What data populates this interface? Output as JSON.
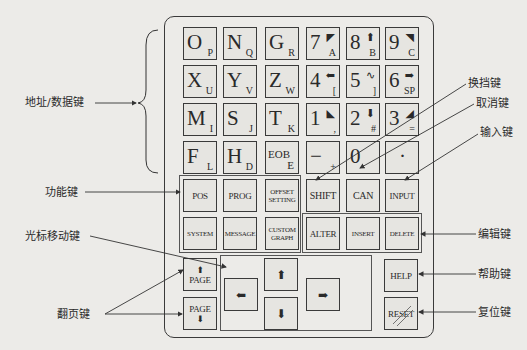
{
  "panel": {
    "address_data_keys": [
      {
        "main": "O",
        "sub": "P"
      },
      {
        "main": "N",
        "sub": "Q"
      },
      {
        "main": "G",
        "sub": "R"
      },
      {
        "main": "7",
        "glyph": "◤",
        "sub": "A"
      },
      {
        "main": "8",
        "glyph": "⬆",
        "sub": "B"
      },
      {
        "main": "9",
        "glyph": "◥",
        "sub": "C"
      },
      {
        "main": "X",
        "sub": "U"
      },
      {
        "main": "Y",
        "sub": "V"
      },
      {
        "main": "Z",
        "sub": "W"
      },
      {
        "main": "4",
        "glyph": "⬅",
        "sub": "["
      },
      {
        "main": "5",
        "glyph": "∿",
        "sub": "]"
      },
      {
        "main": "6",
        "glyph": "➡",
        "sub": "SP"
      },
      {
        "main": "M",
        "sub": "I"
      },
      {
        "main": "S",
        "sub": "J"
      },
      {
        "main": "T",
        "sub": "K"
      },
      {
        "main": "1",
        "glyph": "◣",
        "sub": ","
      },
      {
        "main": "2",
        "glyph": "⬇",
        "sub": "#"
      },
      {
        "main": "3",
        "glyph": "◢",
        "sub": "="
      },
      {
        "main": "F",
        "sub": "L"
      },
      {
        "main": "H",
        "sub": "D"
      },
      {
        "main": "EOB",
        "sub": "E"
      },
      {
        "main": "−",
        "sub": "+"
      },
      {
        "main": "0",
        "sub": "*"
      },
      {
        "main": "·",
        "sub": "/"
      }
    ],
    "function_keys": {
      "pos": "POS",
      "prog": "PROG",
      "offset_setting": "OFFSET SETTING",
      "system": "SYSTEM",
      "message": "MESSAGE",
      "custom_graph": "CUSTOM GRAPH"
    },
    "shift": "SHIFT",
    "can": "CAN",
    "input": "INPUT",
    "alter": "ALTER",
    "insert": "INSERT",
    "delete": "DELETE",
    "page_up": {
      "label": "PAGE",
      "arrow": "⬆"
    },
    "page_down": {
      "label": "PAGE",
      "arrow": "⬇"
    },
    "cursor": {
      "left": "⬅",
      "up": "⬆",
      "down": "⬇",
      "right": "➡"
    },
    "help": "HELP",
    "reset": "RESET"
  },
  "annotations": {
    "address_data": "地址/数据键",
    "function": "功能键",
    "cursor_move": "光标移动键",
    "page_turn": "翻页键",
    "shift": "换挡键",
    "cancel": "取消键",
    "input": "输入键",
    "edit": "编辑键",
    "help": "帮助键",
    "reset": "复位键"
  }
}
